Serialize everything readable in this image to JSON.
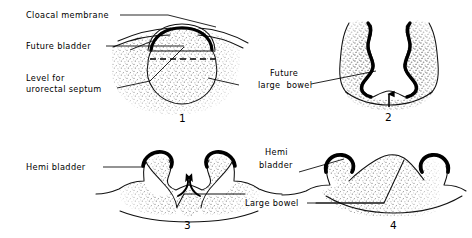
{
  "figure": {
    "background_color": "#ffffff",
    "ink_color": "#000000",
    "stipple_color": "#8a8a8a",
    "panel_count": 4
  },
  "panels": [
    {
      "number": "1",
      "labels": [
        {
          "id": "cloacal-membrane",
          "text": "Cloacal membrane"
        },
        {
          "id": "future-bladder",
          "text": "Future bladder"
        },
        {
          "id": "level-for",
          "text": "Level for"
        },
        {
          "id": "urorectal-septum",
          "text": "urorectal septum"
        }
      ]
    },
    {
      "number": "2",
      "labels": [
        {
          "id": "future",
          "text": "Future"
        },
        {
          "id": "large-bowel",
          "text": "large  bowel"
        }
      ]
    },
    {
      "number": "3",
      "labels": [
        {
          "id": "hemi-bladder",
          "text": "Hemi bladder"
        }
      ]
    },
    {
      "number": "4",
      "labels": [
        {
          "id": "hemi",
          "text": "Hemi"
        },
        {
          "id": "bladder",
          "text": "bladder"
        },
        {
          "id": "large-bowel",
          "text": "Large bowel"
        }
      ]
    }
  ],
  "panel_numbers": {
    "one": "1",
    "two": "2",
    "three": "3",
    "four": "4"
  }
}
